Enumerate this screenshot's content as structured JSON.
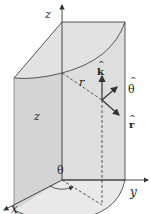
{
  "diagram": {
    "axes": {
      "z": "z",
      "y": "y",
      "x": "x"
    },
    "labels": {
      "height": "z",
      "radius": "r",
      "angle": "θ"
    },
    "unit_vectors": {
      "k": "k",
      "theta": "θ",
      "r": "r",
      "hat": "^"
    },
    "colors": {
      "surface_fill": "#d9d9d9",
      "top_fill": "#e3e3e3",
      "base_fill": "#e6e6e6",
      "line": "#333333",
      "background": "#ffffff"
    }
  }
}
